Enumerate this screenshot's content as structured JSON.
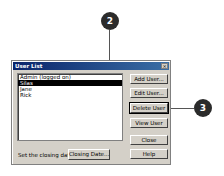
{
  "dialog": {
    "title": "User List",
    "close_icon": "close-icon",
    "users": [
      {
        "label": "Admin (logged on)",
        "selected": false
      },
      {
        "label": "Silas",
        "selected": true
      },
      {
        "label": "Jane",
        "selected": false
      },
      {
        "label": "Rick",
        "selected": false
      }
    ],
    "buttons": {
      "add": "Add User...",
      "edit": "Edit User...",
      "delete": "Delete User",
      "view": "View User",
      "close": "Close",
      "help": "Help"
    },
    "closing_date_label": "Set the closing date:",
    "closing_date_button": "Closing Date..."
  },
  "callouts": [
    {
      "number": "2"
    },
    {
      "number": "3"
    }
  ]
}
